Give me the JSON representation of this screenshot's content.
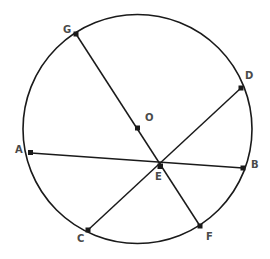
{
  "figure": {
    "background_color": "#ffffff",
    "stroke_color": "#1a1a1a",
    "label_color": "#4a4a4a",
    "marker_color": "#1a1a1a"
  },
  "circle": {
    "center_label": "O",
    "cx": 137.5,
    "cy": 129,
    "r": 114.5,
    "stroke_width": 1.6
  },
  "points": [
    {
      "id": "A",
      "label": "A",
      "x": 31,
      "y": 153,
      "label_x": 15,
      "label_y": 145,
      "on_circle": true
    },
    {
      "id": "B",
      "label": "B",
      "x": 243,
      "y": 168,
      "label_x": 251,
      "label_y": 160,
      "on_circle": true
    },
    {
      "id": "C",
      "label": "C",
      "x": 88,
      "y": 230,
      "label_x": 77,
      "label_y": 234,
      "on_circle": true
    },
    {
      "id": "D",
      "label": "D",
      "x": 241,
      "y": 88,
      "label_x": 245,
      "label_y": 71,
      "on_circle": true
    },
    {
      "id": "E",
      "label": "E",
      "x": 160,
      "y": 166,
      "label_x": 155,
      "label_y": 172,
      "on_circle": false
    },
    {
      "id": "F",
      "label": "F",
      "x": 200,
      "y": 226,
      "label_x": 206,
      "label_y": 232,
      "on_circle": true
    },
    {
      "id": "G",
      "label": "G",
      "x": 76,
      "y": 34,
      "label_x": 63,
      "label_y": 25,
      "on_circle": true
    },
    {
      "id": "O",
      "label": "O",
      "x": 137.5,
      "y": 128,
      "label_x": 145,
      "label_y": 113,
      "on_circle": false
    }
  ],
  "chords": [
    {
      "id": "chord-AB",
      "from": "A",
      "to": "B",
      "label": "A to B"
    },
    {
      "id": "chord-GF",
      "from": "G",
      "to": "F",
      "label": "G to F"
    },
    {
      "id": "chord-CD",
      "from": "C",
      "to": "D",
      "label": "C to D"
    }
  ],
  "intersection": {
    "point": "E",
    "description": "All three chords meet at E"
  }
}
